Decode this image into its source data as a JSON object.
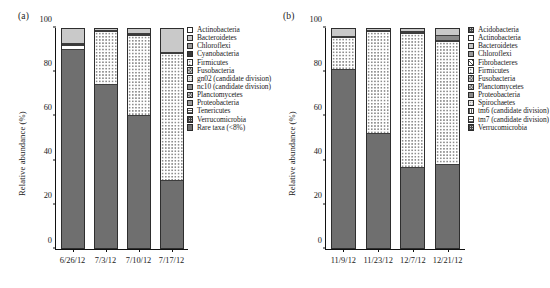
{
  "figure": {
    "panel_a_label": "(a)",
    "panel_b_label": "(b)"
  },
  "chart_data": [
    {
      "type": "bar",
      "panel": "(a)",
      "title": "",
      "xlabel": "",
      "ylabel": "Relative abundance (%)",
      "ylim": [
        0,
        100
      ],
      "yticks": [
        0,
        20,
        40,
        60,
        80,
        100
      ],
      "ytick_labels": [
        "0",
        "20",
        "40",
        "60",
        "80",
        "100"
      ],
      "grid": false,
      "stacked": true,
      "legend_position": "right",
      "categories": [
        "6/26/12",
        "7/3/12",
        "7/10/12",
        "7/17/12"
      ],
      "series": [
        {
          "name": "Rare taxa (<8%)",
          "fill": "f-dark",
          "values": [
            91.0,
            75.0,
            60.8,
            31.0
          ]
        },
        {
          "name": "Proteobacteria",
          "fill": "f-dots",
          "values": [
            0.0,
            24.0,
            36.6,
            58.0
          ]
        },
        {
          "name": "Firmicutes",
          "fill": "f-white",
          "values": [
            1.8,
            0.0,
            0.0,
            0.0
          ]
        },
        {
          "name": "Cyanobacteria",
          "fill": "f-black",
          "values": [
            0.6,
            0.6,
            0.8,
            0.4
          ]
        },
        {
          "name": "Bacteroidetes",
          "fill": "f-ltgray",
          "values": [
            6.6,
            0.4,
            1.8,
            10.6
          ]
        }
      ],
      "legend_entries": [
        {
          "label": "Actinobacteria",
          "fill": "f-white"
        },
        {
          "label": "Bacteroidetes",
          "fill": "f-ltgray"
        },
        {
          "label": "Chloroflexi",
          "fill": "f-midgray"
        },
        {
          "label": "Cyanobacteria",
          "fill": "f-black"
        },
        {
          "label": "Firmicutes",
          "fill": "f-dots"
        },
        {
          "label": "Fusobacteria",
          "fill": "f-cross"
        },
        {
          "label": "gn02 (candidate division)",
          "fill": "f-dots-dense"
        },
        {
          "label": "nc10 (candidate division)",
          "fill": "f-gray"
        },
        {
          "label": "Planctomycetes",
          "fill": "f-cross"
        },
        {
          "label": "Proteobacteria",
          "fill": "f-midgray"
        },
        {
          "label": "Tenericutes",
          "fill": "f-hlines"
        },
        {
          "label": "Verrucomicrobia",
          "fill": "f-grid"
        },
        {
          "label": "Rare taxa (<8%)",
          "fill": "f-dark"
        }
      ]
    },
    {
      "type": "bar",
      "panel": "(b)",
      "title": "",
      "xlabel": "",
      "ylabel": "Relative abundance (%)",
      "ylim": [
        0,
        100
      ],
      "yticks": [
        0,
        20,
        40,
        60,
        80,
        100
      ],
      "ytick_labels": [
        "0",
        "20",
        "40",
        "60",
        "80",
        "100"
      ],
      "grid": false,
      "stacked": true,
      "legend_position": "right",
      "categories": [
        "11/9/12",
        "11/23/12",
        "12/7/12",
        "12/21/12"
      ],
      "series": [
        {
          "name": "Rare taxa",
          "fill": "f-dark",
          "values": [
            81.8,
            52.5,
            37.0,
            38.5
          ]
        },
        {
          "name": "Proteobacteria",
          "fill": "f-dots",
          "values": [
            14.4,
            46.7,
            61.2,
            56.0
          ]
        },
        {
          "name": "Bacteroidetes",
          "fill": "f-midgray",
          "values": [
            0.4,
            0.3,
            0.5,
            0.6
          ]
        },
        {
          "name": "Chloroflexi",
          "fill": "f-gray",
          "values": [
            0.0,
            0.0,
            0.6,
            2.4
          ]
        },
        {
          "name": "Acidobacteria",
          "fill": "f-ltgray",
          "values": [
            3.4,
            0.5,
            0.7,
            2.5
          ]
        }
      ],
      "legend_entries": [
        {
          "label": "Acidobacteria",
          "fill": "f-grid"
        },
        {
          "label": "Actinobacteria",
          "fill": "f-white"
        },
        {
          "label": "Bacteroidetes",
          "fill": "f-ltgray"
        },
        {
          "label": "Chloroflexi",
          "fill": "f-midgray"
        },
        {
          "label": "Fibrobacteres",
          "fill": "f-diag"
        },
        {
          "label": "Firmicutes",
          "fill": "f-dots"
        },
        {
          "label": "Fusobacteria",
          "fill": "f-cross"
        },
        {
          "label": "Planctomycetes",
          "fill": "f-cross"
        },
        {
          "label": "Proteobacteria",
          "fill": "f-gray"
        },
        {
          "label": "Spirochaetes",
          "fill": "f-dots-dense"
        },
        {
          "label": "tm6 (candidate division)",
          "fill": "f-vlines"
        },
        {
          "label": "tm7 (candidate division)",
          "fill": "f-hlines"
        },
        {
          "label": "Verrucomicrobia",
          "fill": "f-grid"
        }
      ]
    }
  ]
}
